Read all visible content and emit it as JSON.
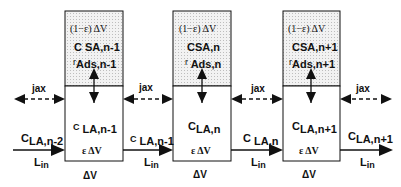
{
  "diagram": {
    "colors": {
      "stroke": "#111111",
      "stipple_bg": "#f2f2f2",
      "stipple_dot": "#bdbdbd"
    },
    "cells": [
      {
        "upper": {
          "volume": "(1−ε) ΔV",
          "conc_prefix": "C",
          "conc_sub": "SA,n-1",
          "rate_prefix": "r",
          "rate_sub": "Ads,n-1"
        },
        "lower": {
          "conc_prefix": "C",
          "conc_sub": "LA,n-1",
          "volume": "ε ΔV"
        },
        "below": "ΔV"
      },
      {
        "upper": {
          "volume": "(1−ε) ΔV",
          "conc_prefix": "C",
          "conc_sub": "SA,n",
          "rate_prefix": "r",
          "rate_sub": "Ads,n"
        },
        "lower": {
          "conc_prefix": "C",
          "conc_sub": "LA,n",
          "volume": "ε ΔV"
        },
        "below": "ΔV"
      },
      {
        "upper": {
          "volume": "(1−ε) ΔV",
          "conc_prefix": "C",
          "conc_sub": "SA,n+1",
          "rate_prefix": "r",
          "rate_sub": "Ads,n+1"
        },
        "lower": {
          "conc_prefix": "C",
          "conc_sub": "LA,n+1",
          "volume": "ε ΔV"
        },
        "below": "ΔV"
      }
    ],
    "flows": [
      {
        "conc_prefix": "C",
        "conc_sub": "LA,n-2",
        "flow": "L",
        "flow_sub": "in"
      },
      {
        "conc_prefix": "C",
        "conc_sub": "LA,n-1",
        "flow": "L",
        "flow_sub": "in"
      },
      {
        "conc_prefix": "C",
        "conc_sub": "LA,n",
        "flow": "L",
        "flow_sub": "in"
      },
      {
        "conc_prefix": "C",
        "conc_sub": "LA,n+1",
        "flow": "L",
        "flow_sub": "in"
      }
    ],
    "dispersion": [
      {
        "label": "jax"
      },
      {
        "label": "jax"
      },
      {
        "label": "jax"
      },
      {
        "label": "jax"
      }
    ]
  }
}
